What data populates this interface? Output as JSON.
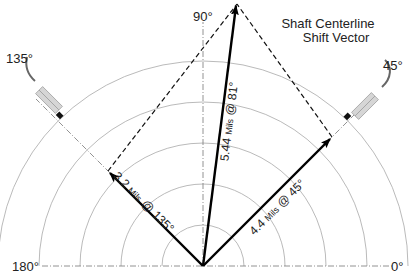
{
  "diagram": {
    "title_line1": "Shaft Centerline",
    "title_line2": "Shift Vector",
    "angle_labels": {
      "deg0": "0°",
      "deg45": "45°",
      "deg90": "90°",
      "deg135": "135°",
      "deg180": "180°"
    },
    "vectors": [
      {
        "id": "probe-135",
        "magnitude": "3.2",
        "unit": "Mils",
        "angle": "135°"
      },
      {
        "id": "resultant",
        "magnitude": "5.44",
        "unit": "Mils",
        "angle": "81°"
      },
      {
        "id": "probe-45",
        "magnitude": "4.4",
        "unit": "Mils",
        "angle": "45°"
      }
    ],
    "vector_separator": "@",
    "colors": {
      "rings": "#9a9a9a",
      "vectors": "#000000",
      "probe_body": "#cfcfcf",
      "cable": "#666666"
    }
  }
}
